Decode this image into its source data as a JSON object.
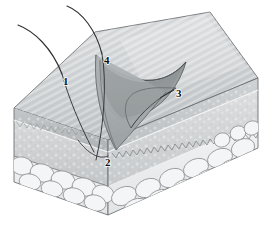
{
  "figure": {
    "background_color": "#ffffff",
    "width": 270,
    "height": 249
  },
  "labels": [
    {
      "id": "label-1",
      "text": "1",
      "x": 63,
      "y": 85,
      "meaning": "hair-shaft-left"
    },
    {
      "id": "label-2",
      "text": "2",
      "x": 105,
      "y": 166,
      "meaning": "hair-follicle-base"
    },
    {
      "id": "label-3",
      "text": "3",
      "x": 176,
      "y": 97,
      "meaning": "excision-margin"
    },
    {
      "id": "label-4",
      "text": "4",
      "x": 104,
      "y": 64,
      "meaning": "hair-shaft-center"
    }
  ],
  "layers": [
    {
      "name": "epidermis",
      "color": "#b9bcbe",
      "edge_color": "#6e7375"
    },
    {
      "name": "dermis",
      "color": "#cdd0d2",
      "edge_color": "#76797b"
    },
    {
      "name": "subcutaneous-fat",
      "color": "#eef0f1",
      "edge_color": "#8a8d8f"
    }
  ],
  "surfaces": {
    "top_face": "#d4d7d9",
    "left_face": "#c3c6c8",
    "right_face": "#cfd2d4",
    "cavity_far_wall": "#8f9496",
    "cavity_near_wall": "#a9adaf",
    "cavity_floor": "#9ba0a2"
  },
  "features": {
    "hair_count": 2,
    "hair_color": "#2d3032",
    "excision_shape": "wedge",
    "outline_color": "#5b6062"
  }
}
